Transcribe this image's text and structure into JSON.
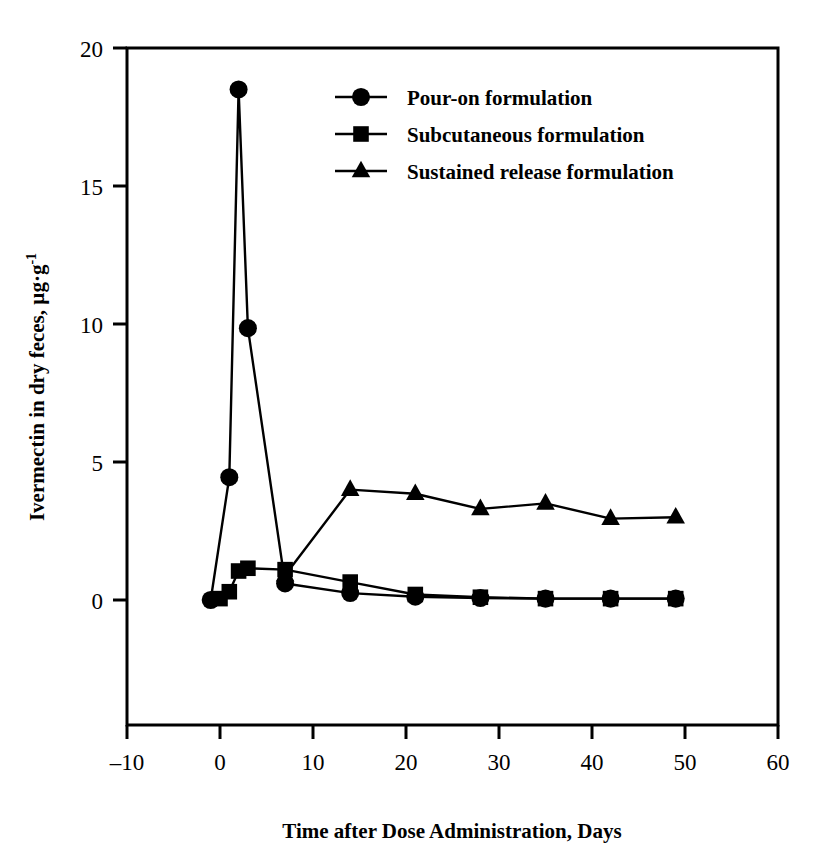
{
  "figure": {
    "background_color": "#ffffff",
    "ink_color": "#000000"
  },
  "chart_data": {
    "type": "line",
    "title": "",
    "xlabel": "Time after Dose Administration, Days",
    "ylabel": "Ivermectin in dry feces, µg·g",
    "ylabel_superscript": "-1",
    "xlim": [
      -10,
      60
    ],
    "ylim": [
      0,
      20
    ],
    "xticks": [
      -10,
      0,
      10,
      20,
      30,
      40,
      50,
      60
    ],
    "xtick_labels": [
      "–10",
      "0",
      "10",
      "20",
      "30",
      "40",
      "50",
      "60"
    ],
    "yticks": [
      0,
      5,
      10,
      15,
      20
    ],
    "ytick_labels": [
      "0",
      "5",
      "10",
      "15",
      "20"
    ],
    "grid": false,
    "legend_position": "upper center",
    "series": [
      {
        "name": "Pour-on formulation",
        "marker": "circle",
        "x": [
          -1,
          1,
          2,
          3,
          7,
          14,
          21,
          28,
          35,
          42,
          49
        ],
        "y": [
          0.0,
          4.45,
          18.5,
          9.85,
          0.6,
          0.25,
          0.12,
          0.07,
          0.05,
          0.05,
          0.05
        ]
      },
      {
        "name": "Subcutaneous formulation",
        "marker": "square",
        "x": [
          0,
          1,
          2,
          3,
          7,
          14,
          21,
          28,
          35,
          42,
          49
        ],
        "y": [
          0.05,
          0.3,
          1.05,
          1.15,
          1.1,
          0.65,
          0.2,
          0.1,
          0.05,
          0.05,
          0.05
        ]
      },
      {
        "name": "Sustained release formulation",
        "marker": "triangle",
        "x": [
          7,
          14,
          21,
          28,
          35,
          42,
          49
        ],
        "y": [
          0.9,
          4.0,
          3.85,
          3.3,
          3.5,
          2.95,
          3.0
        ]
      }
    ]
  },
  "legend": {
    "items": [
      {
        "label": "Pour-on formulation",
        "marker": "circle"
      },
      {
        "label": "Subcutaneous formulation",
        "marker": "square"
      },
      {
        "label": "Sustained release formulation",
        "marker": "triangle"
      }
    ]
  }
}
